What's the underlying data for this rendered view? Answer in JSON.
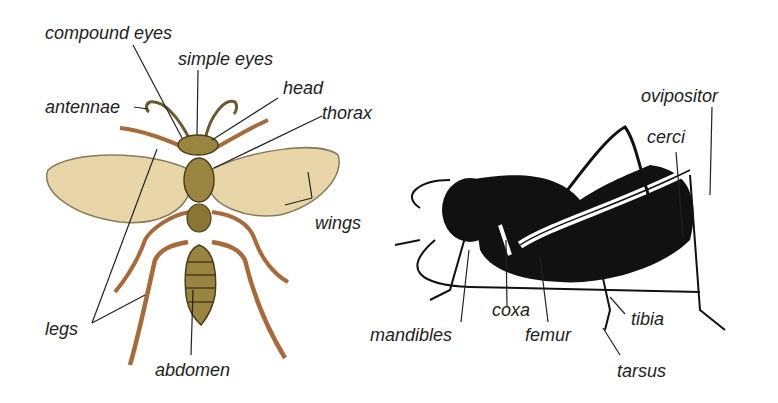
{
  "diagram": {
    "left_insect": {
      "name": "wasp",
      "labels": {
        "compound_eyes": "compound eyes",
        "simple_eyes": "simple eyes",
        "head": "head",
        "antennae": "antennae",
        "thorax": "thorax",
        "wings": "wings",
        "legs": "legs",
        "abdomen": "abdomen"
      }
    },
    "right_insect": {
      "name": "cricket",
      "labels": {
        "ovipositor": "ovipositor",
        "cerci": "cerci",
        "coxa": "coxa",
        "mandibles": "mandibles",
        "femur": "femur",
        "tibia": "tibia",
        "tarsus": "tarsus"
      }
    },
    "colors": {
      "wing": "#e8d6a8",
      "wing_edge": "#8a7a5a",
      "body": "#9a8540",
      "leg": "#a86a3a",
      "cricket": "#111111",
      "line": "#222222"
    }
  }
}
